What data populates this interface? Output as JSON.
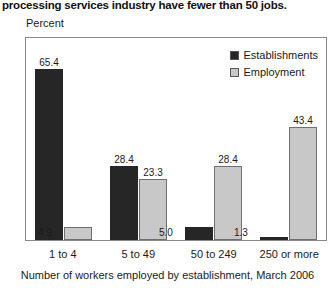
{
  "chart_data": {
    "type": "bar",
    "title": "processing services industry have fewer than 50 jobs.",
    "xlabel": "Number of workers employed by establishment, March 2006",
    "ylabel": "Percent",
    "categories": [
      "1 to 4",
      "5 to 49",
      "50 to 249",
      "250 or more"
    ],
    "series": [
      {
        "name": "Establishments",
        "color": "#262626",
        "values": [
          65.4,
          28.4,
          5.0,
          1.3
        ],
        "labels": [
          "65.4",
          "28.4",
          "5.0",
          "1.3"
        ]
      },
      {
        "name": "Employment",
        "color": "#c8c8c8",
        "values": [
          4.9,
          23.3,
          28.4,
          43.4
        ],
        "labels": [
          "4.9",
          "23.3",
          "28.4",
          "43.4"
        ]
      }
    ],
    "ylim": [
      0,
      72
    ],
    "grid": false,
    "y_ticks_visible": false,
    "legend_position": "top-right"
  }
}
